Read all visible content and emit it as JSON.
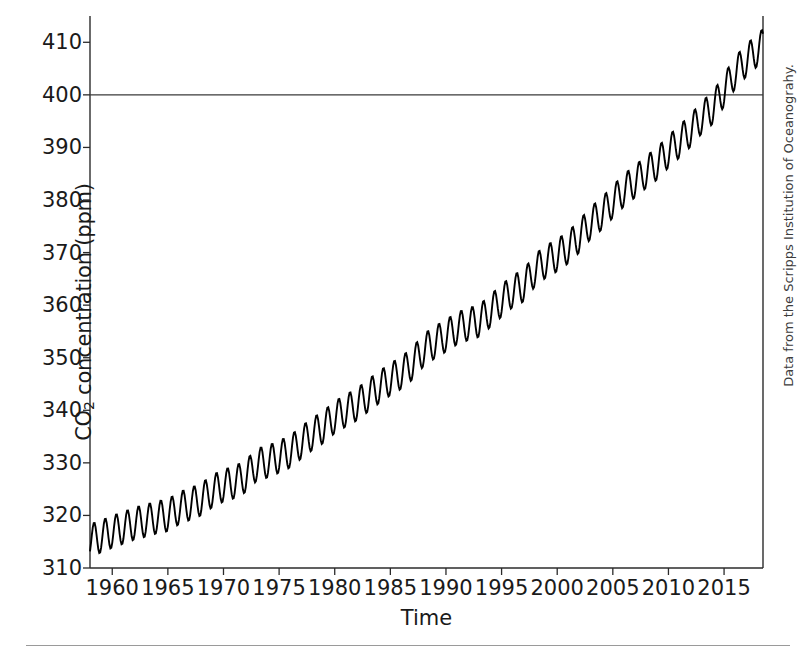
{
  "chart_data": {
    "type": "line",
    "title": "",
    "xlabel": "Time",
    "ylabel": "CO2 concentration (ppm)",
    "ylabel_parts": {
      "prefix": "CO",
      "sub": "2",
      "suffix": " concentration (ppm)"
    },
    "xlim": [
      1958,
      2018.5
    ],
    "ylim": [
      310,
      415
    ],
    "yticks": [
      310,
      320,
      330,
      340,
      350,
      360,
      370,
      380,
      390,
      400,
      410
    ],
    "ytick_labels": [
      "310",
      "320",
      "330",
      "340",
      "350",
      "360",
      "370",
      "380",
      "390",
      "400",
      "410"
    ],
    "xticks": [
      1960,
      1965,
      1970,
      1975,
      1980,
      1985,
      1990,
      1995,
      2000,
      2005,
      2010,
      2015
    ],
    "xtick_labels": [
      "1960",
      "1965",
      "1970",
      "1975",
      "1980",
      "1985",
      "1990",
      "1995",
      "2000",
      "2005",
      "2010",
      "2015"
    ],
    "grid": false,
    "legend": "none",
    "line_color": "#000000",
    "line_width": 1.9,
    "reference_line": {
      "y": 400,
      "color": "#3a3a3a",
      "width": 1.2,
      "label": "400"
    },
    "seasonal_amplitude_ppm": 6.2,
    "series": [
      {
        "name": "Mauna Loa atmospheric CO2 (monthly mean)",
        "annual_mean_x": [
          1958,
          1959,
          1960,
          1961,
          1962,
          1963,
          1964,
          1965,
          1966,
          1967,
          1968,
          1969,
          1970,
          1971,
          1972,
          1973,
          1974,
          1975,
          1976,
          1977,
          1978,
          1979,
          1980,
          1981,
          1982,
          1983,
          1984,
          1985,
          1986,
          1987,
          1988,
          1989,
          1990,
          1991,
          1992,
          1993,
          1994,
          1995,
          1996,
          1997,
          1998,
          1999,
          2000,
          2001,
          2002,
          2003,
          2004,
          2005,
          2006,
          2007,
          2008,
          2009,
          2010,
          2011,
          2012,
          2013,
          2014,
          2015,
          2016,
          2017,
          2018
        ],
        "annual_mean_y": [
          315.3,
          315.98,
          316.91,
          317.64,
          318.45,
          318.99,
          319.62,
          320.04,
          321.37,
          322.18,
          323.05,
          324.62,
          325.68,
          326.32,
          327.46,
          329.68,
          330.25,
          331.15,
          332.15,
          333.9,
          335.5,
          336.85,
          338.69,
          339.93,
          341.13,
          342.78,
          344.42,
          345.9,
          347.15,
          348.93,
          351.48,
          352.91,
          354.19,
          355.59,
          356.37,
          357.04,
          358.89,
          360.88,
          362.64,
          363.76,
          366.63,
          368.31,
          369.48,
          371.02,
          373.1,
          375.64,
          377.38,
          379.67,
          381.84,
          383.55,
          385.34,
          386.95,
          389.21,
          391.15,
          393.22,
          395.72,
          397.55,
          400.83,
          404.24,
          406.55,
          408.52
        ]
      }
    ]
  },
  "axes": {
    "y_axis_name": "CO2 concentration axis",
    "x_axis_name": "Time axis"
  },
  "credit": {
    "text": "Data from the Scripps Institution of Oceanograhy."
  }
}
